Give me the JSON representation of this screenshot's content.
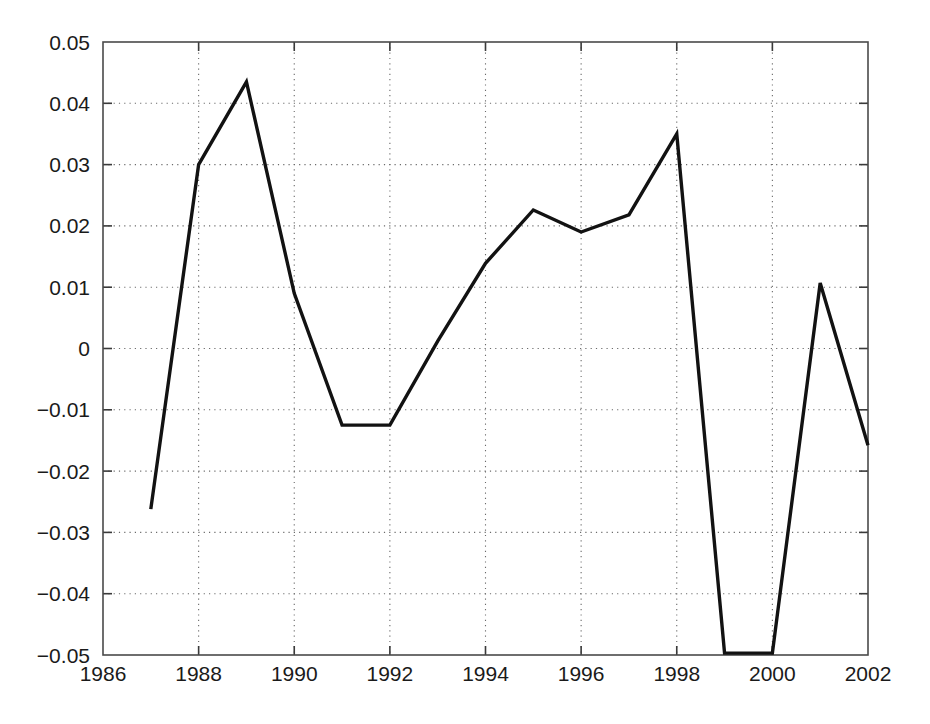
{
  "chart_data": {
    "type": "line",
    "title": "",
    "subtitle": "",
    "xlabel": "",
    "ylabel": "",
    "x": [
      1987,
      1988,
      1989,
      1990,
      1991,
      1992,
      1993,
      1994,
      1995,
      1996,
      1997,
      1998,
      1999,
      2000,
      2001,
      2002
    ],
    "values": [
      -0.0262,
      0.03,
      0.0435,
      0.009,
      -0.0125,
      -0.0125,
      0.0012,
      0.0139,
      0.0226,
      0.019,
      0.0218,
      0.035,
      -0.0497,
      -0.0497,
      0.0107,
      -0.0158
    ],
    "series": [
      {
        "name": "series-1",
        "values": [
          -0.0262,
          0.03,
          0.0435,
          0.009,
          -0.0125,
          -0.0125,
          0.0012,
          0.0139,
          0.0226,
          0.019,
          0.0218,
          0.035,
          -0.0497,
          -0.0497,
          0.0107,
          -0.0158
        ],
        "color": "#121212"
      }
    ],
    "xlim": [
      1986,
      2002
    ],
    "ylim": [
      -0.05,
      0.05
    ],
    "xticks": [
      1986,
      1988,
      1990,
      1992,
      1994,
      1996,
      1998,
      2000,
      2002
    ],
    "xtick_labels": [
      "1986",
      "1988",
      "1990",
      "1992",
      "1994",
      "1996",
      "1998",
      "2000",
      "2002"
    ],
    "yticks": [
      -0.05,
      -0.04,
      -0.03,
      -0.02,
      -0.01,
      0,
      0.01,
      0.02,
      0.03,
      0.04,
      0.05
    ],
    "ytick_labels": [
      "−0.05",
      "−0.04",
      "−0.03",
      "−0.02",
      "−0.01",
      "0",
      "0.01",
      "0.02",
      "0.03",
      "0.04",
      "0.05"
    ],
    "grid": true,
    "grid_style": "dotted",
    "legend": null,
    "legend_position": "none",
    "annotations": [],
    "line_color": "#121212",
    "background_color": "#ffffff",
    "axis_color": "#4a4a4a"
  }
}
